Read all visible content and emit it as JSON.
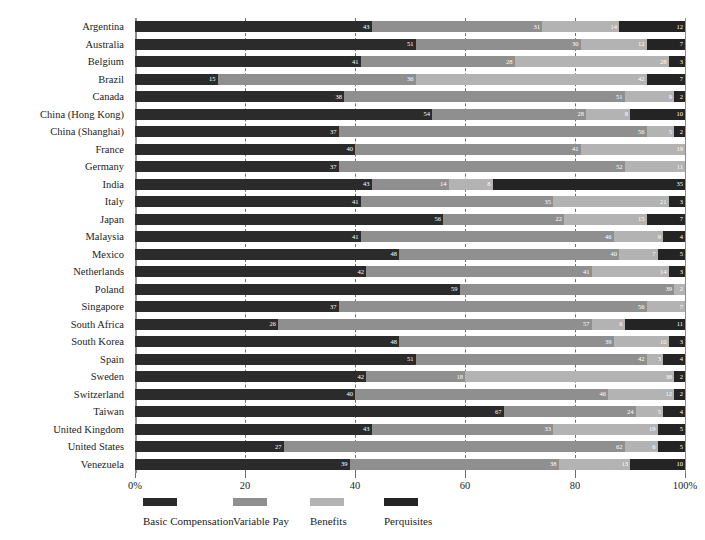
{
  "chart_data": {
    "type": "bar",
    "orientation": "horizontal",
    "stacked": true,
    "stack_total": 100,
    "title": "",
    "xlabel": "",
    "ylabel": "",
    "xlim": [
      0,
      100
    ],
    "grid": true,
    "gridlines": [
      20,
      40,
      60,
      80,
      100
    ],
    "legend_position": "bottom",
    "series": [
      {
        "name": "Basic Compensation",
        "color": "#2b2b2b"
      },
      {
        "name": "Variable Pay",
        "color": "#8f8f8f"
      },
      {
        "name": "Benefits",
        "color": "#b3b3b3"
      },
      {
        "name": "Perquisites",
        "color": "#242424"
      }
    ],
    "categories": [
      "Argentina",
      "Australia",
      "Belgium",
      "Brazil",
      "Canada",
      "China (Hong Kong)",
      "China (Shanghai)",
      "France",
      "Germany",
      "India",
      "Italy",
      "Japan",
      "Malaysia",
      "Mexico",
      "Netherlands",
      "Poland",
      "Singapore",
      "South Africa",
      "South Korea",
      "Spain",
      "Sweden",
      "Switzerland",
      "Taiwan",
      "United Kingdom",
      "United States",
      "Venezuela"
    ],
    "rows": [
      {
        "category": "Argentina",
        "values": [
          43,
          31,
          14,
          12
        ]
      },
      {
        "category": "Australia",
        "values": [
          51,
          30,
          12,
          7
        ]
      },
      {
        "category": "Belgium",
        "values": [
          41,
          28,
          28,
          3
        ]
      },
      {
        "category": "Brazil",
        "values": [
          15,
          36,
          42,
          7
        ]
      },
      {
        "category": "Canada",
        "values": [
          38,
          51,
          9,
          2
        ]
      },
      {
        "category": "China (Hong Kong)",
        "values": [
          54,
          28,
          8,
          10
        ]
      },
      {
        "category": "China (Shanghai)",
        "values": [
          37,
          56,
          5,
          2
        ]
      },
      {
        "category": "France",
        "values": [
          40,
          41,
          19,
          0
        ]
      },
      {
        "category": "Germany",
        "values": [
          37,
          52,
          11,
          0
        ]
      },
      {
        "category": "India",
        "values": [
          43,
          14,
          8,
          35
        ]
      },
      {
        "category": "Italy",
        "values": [
          41,
          35,
          21,
          3
        ]
      },
      {
        "category": "Japan",
        "values": [
          56,
          22,
          15,
          7
        ]
      },
      {
        "category": "Malaysia",
        "values": [
          41,
          46,
          9,
          4
        ]
      },
      {
        "category": "Mexico",
        "values": [
          48,
          40,
          7,
          5
        ]
      },
      {
        "category": "Netherlands",
        "values": [
          42,
          41,
          14,
          3
        ]
      },
      {
        "category": "Poland",
        "values": [
          59,
          39,
          2,
          0
        ]
      },
      {
        "category": "Singapore",
        "values": [
          37,
          56,
          7,
          0
        ]
      },
      {
        "category": "South Africa",
        "values": [
          26,
          57,
          6,
          11
        ]
      },
      {
        "category": "South Korea",
        "values": [
          48,
          39,
          10,
          3
        ]
      },
      {
        "category": "Spain",
        "values": [
          51,
          42,
          3,
          4
        ]
      },
      {
        "category": "Sweden",
        "values": [
          42,
          18,
          38,
          2
        ]
      },
      {
        "category": "Switzerland",
        "values": [
          40,
          46,
          12,
          2
        ]
      },
      {
        "category": "Taiwan",
        "values": [
          67,
          24,
          5,
          4
        ]
      },
      {
        "category": "United Kingdom",
        "values": [
          43,
          33,
          19,
          5
        ]
      },
      {
        "category": "United States",
        "values": [
          27,
          62,
          6,
          5
        ]
      },
      {
        "category": "Venezuela",
        "values": [
          39,
          38,
          13,
          10
        ]
      }
    ],
    "x_ticks": [
      {
        "value": 0,
        "label": "0%"
      },
      {
        "value": 20,
        "label": "20"
      },
      {
        "value": 40,
        "label": "40"
      },
      {
        "value": 60,
        "label": "60"
      },
      {
        "value": 80,
        "label": "80"
      },
      {
        "value": 100,
        "label": "100%"
      }
    ]
  }
}
